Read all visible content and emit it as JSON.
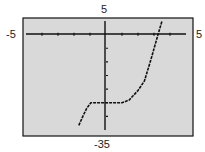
{
  "window": {
    "xmin": "-5",
    "xmax": "5",
    "ymax": "5",
    "ymin": "-35"
  },
  "colors": {
    "screen": "#d9d9d9",
    "frame": "#111111",
    "curve": "#111111"
  },
  "chart_data": {
    "type": "line",
    "title": "",
    "xlabel": "",
    "ylabel": "",
    "xlim": [
      -5,
      5
    ],
    "ylim": [
      -35,
      5
    ],
    "x_tick_spacing": 1,
    "y_tick_spacing": 5,
    "grid": false,
    "legend": null,
    "tick_labels": {
      "left": "-5",
      "right": "5",
      "top": "5",
      "bottom": "-35"
    },
    "series": [
      {
        "name": "f(x)",
        "x": [
          -1.7,
          -1.45,
          -1.2,
          -0.95,
          -0.45,
          0.3,
          1.0,
          1.45,
          2.0,
          2.4,
          2.8,
          3.25,
          3.5
        ],
        "y": [
          -33.3,
          -30,
          -27,
          -25,
          -25,
          -25,
          -25,
          -24,
          -20.5,
          -17,
          -9.3,
          0,
          5
        ]
      }
    ]
  }
}
